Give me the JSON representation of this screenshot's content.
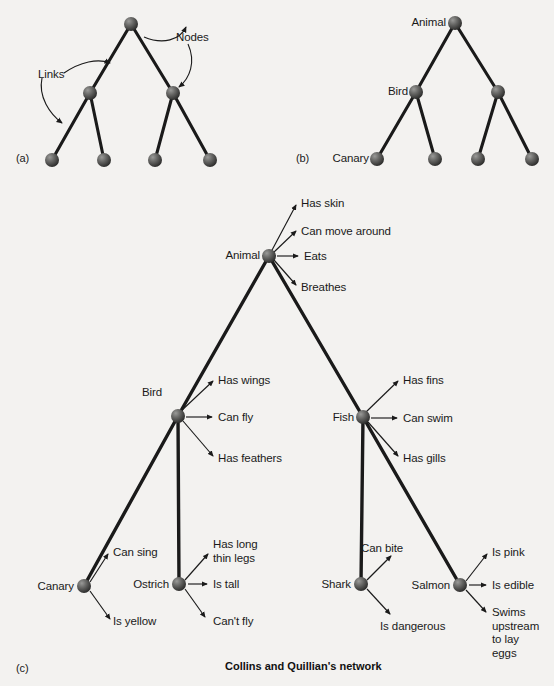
{
  "figure": {
    "caption": "Collins and Quillian's network",
    "background_color": "#f3f2f0",
    "node_color": "#4a4a4a",
    "link_color": "#1a1a1a"
  },
  "panels": [
    {
      "tag": "(a)",
      "name": "generic-network"
    },
    {
      "tag": "(b)",
      "name": "labelled-network"
    },
    {
      "tag": "(c)",
      "name": "collins-quillian-network"
    }
  ],
  "panel_a": {
    "tag": "(a)",
    "annotations": [
      {
        "text": "Nodes",
        "x": 176,
        "y": 31
      },
      {
        "text": "Links",
        "x": 38,
        "y": 68
      }
    ],
    "nodes": [
      {
        "id": "a-root",
        "x": 131,
        "y": 24,
        "label": ""
      },
      {
        "id": "a-l",
        "x": 90,
        "y": 93,
        "label": ""
      },
      {
        "id": "a-r",
        "x": 173,
        "y": 93,
        "label": ""
      },
      {
        "id": "a-ll",
        "x": 52,
        "y": 160,
        "label": ""
      },
      {
        "id": "a-lr",
        "x": 104,
        "y": 160,
        "label": ""
      },
      {
        "id": "a-rl",
        "x": 155,
        "y": 160,
        "label": ""
      },
      {
        "id": "a-rr",
        "x": 210,
        "y": 160,
        "label": ""
      }
    ],
    "links": [
      [
        "a-root",
        "a-l"
      ],
      [
        "a-root",
        "a-r"
      ],
      [
        "a-l",
        "a-ll"
      ],
      [
        "a-l",
        "a-lr"
      ],
      [
        "a-r",
        "a-rl"
      ],
      [
        "a-r",
        "a-rr"
      ]
    ]
  },
  "panel_b": {
    "tag": "(b)",
    "nodes": [
      {
        "id": "b-root",
        "x": 455,
        "y": 23,
        "label": "Animal",
        "label_side": "left"
      },
      {
        "id": "b-l",
        "x": 416,
        "y": 92,
        "label": "Bird",
        "label_side": "left"
      },
      {
        "id": "b-r",
        "x": 498,
        "y": 92,
        "label": ""
      },
      {
        "id": "b-ll",
        "x": 377,
        "y": 159,
        "label": "Canary",
        "label_side": "left"
      },
      {
        "id": "b-lr",
        "x": 435,
        "y": 159,
        "label": ""
      },
      {
        "id": "b-rl",
        "x": 478,
        "y": 159,
        "label": ""
      },
      {
        "id": "b-rr",
        "x": 532,
        "y": 159,
        "label": ""
      }
    ],
    "links": [
      [
        "b-root",
        "b-l"
      ],
      [
        "b-root",
        "b-r"
      ],
      [
        "b-l",
        "b-ll"
      ],
      [
        "b-l",
        "b-lr"
      ],
      [
        "b-r",
        "b-rl"
      ],
      [
        "b-r",
        "b-rr"
      ]
    ]
  },
  "panel_c": {
    "tag": "(c)",
    "concept_nodes": [
      {
        "id": "animal",
        "label": "Animal",
        "x": 269,
        "y": 256
      },
      {
        "id": "bird",
        "label": "Bird",
        "x": 178,
        "y": 416
      },
      {
        "id": "fish",
        "label": "Fish",
        "x": 363,
        "y": 417
      },
      {
        "id": "canary",
        "label": "Canary",
        "x": 84,
        "y": 586
      },
      {
        "id": "ostrich",
        "label": "Ostrich",
        "x": 179,
        "y": 584
      },
      {
        "id": "shark",
        "label": "Shark",
        "x": 361,
        "y": 584
      },
      {
        "id": "salmon",
        "label": "Salmon",
        "x": 460,
        "y": 585
      }
    ],
    "isa_links": [
      [
        "animal",
        "bird"
      ],
      [
        "animal",
        "fish"
      ],
      [
        "bird",
        "canary"
      ],
      [
        "bird",
        "ostrich"
      ],
      [
        "fish",
        "shark"
      ],
      [
        "fish",
        "salmon"
      ]
    ],
    "properties": [
      {
        "owner": "animal",
        "text": "Has skin",
        "tx": 301,
        "ty": 197,
        "ax": 296,
        "ay": 203
      },
      {
        "owner": "animal",
        "text": "Can move around",
        "tx": 301,
        "ty": 225,
        "ax": 296,
        "ay": 231
      },
      {
        "owner": "animal",
        "text": "Eats",
        "tx": 304,
        "ty": 250,
        "ax": 296,
        "ay": 256
      },
      {
        "owner": "animal",
        "text": "Breathes",
        "tx": 301,
        "ty": 281,
        "ax": 296,
        "ay": 287
      },
      {
        "owner": "bird",
        "text": "Has wings",
        "tx": 218,
        "ty": 374,
        "ax": 213,
        "ay": 380
      },
      {
        "owner": "bird",
        "text": "Can fly",
        "tx": 218,
        "ty": 411,
        "ax": 210,
        "ay": 417
      },
      {
        "owner": "bird",
        "text": "Has feathers",
        "tx": 218,
        "ty": 452,
        "ax": 213,
        "ay": 458
      },
      {
        "owner": "fish",
        "text": "Has fins",
        "tx": 403,
        "ty": 374,
        "ax": 398,
        "ay": 380
      },
      {
        "owner": "fish",
        "text": "Can swim",
        "tx": 403,
        "ty": 412,
        "ax": 395,
        "ay": 418
      },
      {
        "owner": "fish",
        "text": "Has gills",
        "tx": 403,
        "ty": 452,
        "ax": 398,
        "ay": 458
      },
      {
        "owner": "canary",
        "text": "Can sing",
        "tx": 113,
        "ty": 546,
        "ax": 108,
        "ay": 552
      },
      {
        "owner": "canary",
        "text": "Is yellow",
        "tx": 113,
        "ty": 615,
        "ax": 108,
        "ay": 621
      },
      {
        "owner": "ostrich",
        "text": "Has long\nthin legs",
        "tx": 213,
        "ty": 538,
        "ax": 208,
        "ay": 552
      },
      {
        "owner": "ostrich",
        "text": "Is tall",
        "tx": 213,
        "ty": 578,
        "ax": 205,
        "ay": 584
      },
      {
        "owner": "ostrich",
        "text": "Can't fly",
        "tx": 213,
        "ty": 615,
        "ax": 208,
        "ay": 621
      },
      {
        "owner": "shark",
        "text": "Can bite",
        "tx": 361,
        "ty": 542,
        "ax": 390,
        "ay": 556
      },
      {
        "owner": "shark",
        "text": "Is dangerous",
        "tx": 380,
        "ty": 620,
        "ax": 390,
        "ay": 616
      },
      {
        "owner": "salmon",
        "text": "Is pink",
        "tx": 492,
        "ty": 546,
        "ax": 487,
        "ay": 552
      },
      {
        "owner": "salmon",
        "text": "Is edible",
        "tx": 492,
        "ty": 579,
        "ax": 484,
        "ay": 585
      },
      {
        "owner": "salmon",
        "text": "Swims\nupstream\nto lay\neggs",
        "tx": 492,
        "ty": 606,
        "ax": 487,
        "ay": 613
      }
    ]
  }
}
